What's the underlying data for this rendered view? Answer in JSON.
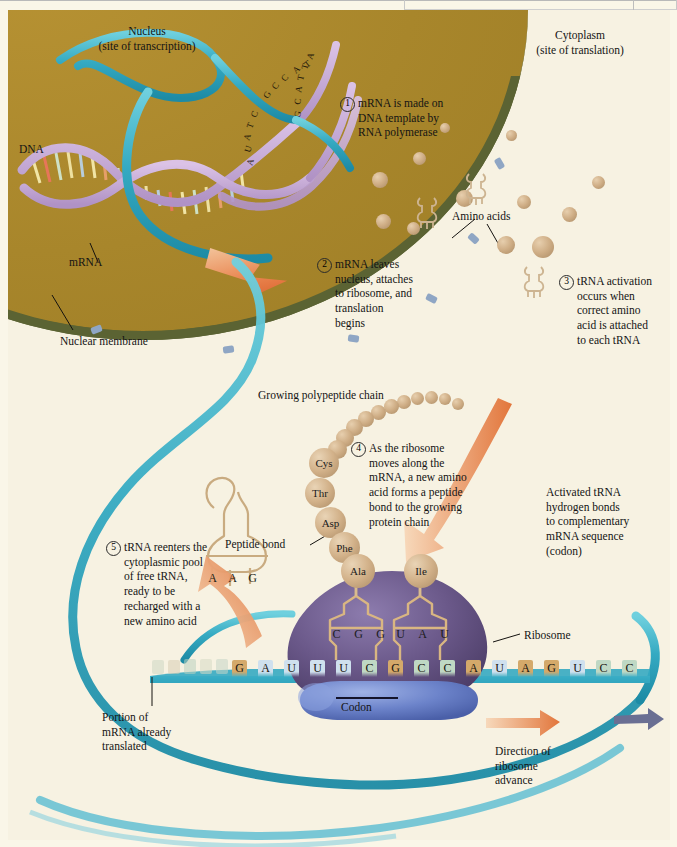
{
  "figure": {
    "domain_label": "protein-synthesis-diagram",
    "colors": {
      "nucleus": "#a8862b",
      "nuclear_membrane": "#5b6333",
      "cytoplasm": "#f7f2e2",
      "mrna": "#31a8c0",
      "dna_backbone": "#c3a8d6",
      "ribosome": "#6d5b8e",
      "ribosome_small": "#5f77bf",
      "arrow_orange": "#e2743a",
      "amino_acid": "#cfae86",
      "trna": "#d8c0a0"
    }
  },
  "regions": {
    "nucleus_label": "Nucleus\n(site of transcription)",
    "nucleus_title": "Nucleus",
    "nucleus_sub": "(site of transcription)",
    "cytoplasm_title": "Cytoplasm",
    "cytoplasm_sub": "(site of translation)"
  },
  "labels": {
    "dna": "DNA",
    "mrna": "mRNA",
    "nuclear_membrane": "Nuclear membrane",
    "amino_acids": "Amino acids",
    "growing_polypeptide": "Growing polypeptide chain",
    "peptide_bond": "Peptide bond",
    "ribosome": "Ribosome",
    "codon": "Codon",
    "activated_trna": "Activated tRNA\nhydrogen bonds\nto complementary\nmRNA sequence\n(codon)",
    "activated_trna_lines": [
      "Activated tRNA",
      "hydrogen bonds",
      "to complementary",
      "mRNA sequence",
      "(codon)"
    ],
    "portion_translated_lines": [
      "Portion of",
      "mRNA already",
      "translated"
    ],
    "direction_lines": [
      "Direction of",
      "ribosome",
      "advance"
    ]
  },
  "steps": [
    {
      "number": "1",
      "lines": [
        "mRNA is made on",
        "DNA template by",
        "RNA polymerase"
      ]
    },
    {
      "number": "2",
      "lines": [
        "mRNA leaves",
        "nucleus, attaches",
        "to ribosome, and",
        "translation",
        "begins"
      ]
    },
    {
      "number": "3",
      "lines": [
        "tRNA activation",
        "occurs when",
        "correct amino",
        "acid is attached",
        "to each tRNA"
      ]
    },
    {
      "number": "4",
      "lines": [
        "As the ribosome",
        "moves along the",
        "mRNA, a new amino",
        "acid forms a peptide",
        "bond to the growing",
        "protein chain"
      ]
    },
    {
      "number": "5",
      "lines": [
        "tRNA reenters the",
        "cytoplasmic pool",
        "of free tRNA,",
        "ready to be",
        "recharged with a",
        "new amino acid"
      ]
    }
  ],
  "polypeptide": {
    "labeled_residues": [
      "Cys",
      "Thr",
      "Asp",
      "Phe",
      "Ala"
    ],
    "incoming_residue": "Ile",
    "unlabeled_bead_count": 11
  },
  "mrna_strand": {
    "bases": [
      "G",
      "A",
      "U",
      "U",
      "U",
      "C",
      "G",
      "C",
      "C",
      "A",
      "U",
      "A",
      "G",
      "U",
      "C",
      "C"
    ]
  },
  "trna_in_ribosome": {
    "anticodon_left": [
      "C",
      "G",
      "G"
    ],
    "anticodon_right": [
      "U",
      "A",
      "U"
    ]
  },
  "free_trna": {
    "anticodon": [
      "A",
      "A",
      "G"
    ]
  },
  "dna_template_bases": [
    "A",
    "T",
    "A",
    "C",
    "G",
    "G",
    "T",
    "C",
    "A",
    "T",
    "T",
    "A",
    "G",
    "C",
    "C",
    "G",
    "C",
    "T",
    "A",
    "U"
  ]
}
